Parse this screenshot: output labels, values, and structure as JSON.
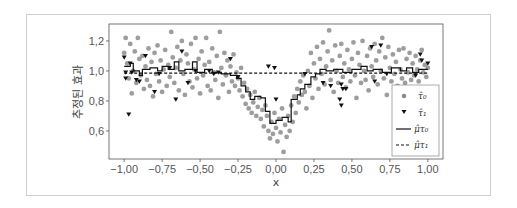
{
  "chart_data": {
    "type": "scatter",
    "title": "",
    "xlabel": "x",
    "ylabel": "추정된 효과",
    "xlim": [
      -1.1,
      1.1
    ],
    "ylim": [
      0.413,
      1.313
    ],
    "xticks": [
      "-1.00",
      "-0.75",
      "-0.50",
      "-0.25",
      "0.00",
      "0.25",
      "0.50",
      "0.75",
      "1.00"
    ],
    "yticks": [
      "0.6",
      "0.8",
      "1.0",
      "1.2"
    ],
    "grid": false,
    "legend_position": "lower right",
    "legend": [
      "τ̂₀",
      "τ̂₁",
      "μ̂τ₀",
      "μ̂τ₁"
    ],
    "series": [
      {
        "name": "τ̂₀",
        "kind": "scatter",
        "marker": "circle",
        "color": "#8c8c8c",
        "points": [
          [
            -1.0,
            1.12
          ],
          [
            -0.99,
            1.22
          ],
          [
            -0.98,
            1.05
          ],
          [
            -0.97,
            0.95
          ],
          [
            -0.96,
            1.18
          ],
          [
            -0.95,
            0.85
          ],
          [
            -0.94,
            1.0
          ],
          [
            -0.93,
            1.13
          ],
          [
            -0.92,
            0.92
          ],
          [
            -0.91,
            1.22
          ],
          [
            -0.9,
            1.08
          ],
          [
            -0.89,
            0.97
          ],
          [
            -0.88,
            1.1
          ],
          [
            -0.87,
            0.88
          ],
          [
            -0.86,
            1.03
          ],
          [
            -0.85,
            0.94
          ],
          [
            -0.84,
            1.15
          ],
          [
            -0.83,
            0.9
          ],
          [
            -0.82,
            1.06
          ],
          [
            -0.81,
            0.83
          ],
          [
            -0.8,
            1.12
          ],
          [
            -0.79,
            0.98
          ],
          [
            -0.78,
            1.17
          ],
          [
            -0.77,
            0.93
          ],
          [
            -0.76,
            1.07
          ],
          [
            -0.75,
            0.86
          ],
          [
            -0.74,
            1.01
          ],
          [
            -0.73,
            1.14
          ],
          [
            -0.72,
            0.9
          ],
          [
            -0.71,
            1.04
          ],
          [
            -0.7,
            0.96
          ],
          [
            -0.69,
            1.26
          ],
          [
            -0.68,
            1.09
          ],
          [
            -0.67,
            0.92
          ],
          [
            -0.66,
            1.02
          ],
          [
            -0.65,
            1.16
          ],
          [
            -0.64,
            0.87
          ],
          [
            -0.63,
            1.07
          ],
          [
            -0.62,
            1.2
          ],
          [
            -0.61,
            0.98
          ],
          [
            -0.6,
            0.84
          ],
          [
            -0.59,
            1.11
          ],
          [
            -0.58,
            1.05
          ],
          [
            -0.57,
            0.93
          ],
          [
            -0.56,
            1.18
          ],
          [
            -0.55,
            0.89
          ],
          [
            -0.54,
            1.01
          ],
          [
            -0.53,
            1.22
          ],
          [
            -0.52,
            0.95
          ],
          [
            -0.51,
            1.08
          ],
          [
            -0.5,
            0.85
          ],
          [
            -0.49,
            1.13
          ],
          [
            -0.48,
            0.97
          ],
          [
            -0.47,
            1.04
          ],
          [
            -0.46,
            1.22
          ],
          [
            -0.45,
            0.9
          ],
          [
            -0.44,
            1.06
          ],
          [
            -0.43,
            0.87
          ],
          [
            -0.42,
            1.15
          ],
          [
            -0.41,
            0.99
          ],
          [
            -0.4,
            0.94
          ],
          [
            -0.39,
            1.1
          ],
          [
            -0.38,
            0.82
          ],
          [
            -0.37,
            1.26
          ],
          [
            -0.36,
            1.02
          ],
          [
            -0.35,
            0.91
          ],
          [
            -0.34,
            1.12
          ],
          [
            -0.33,
            0.97
          ],
          [
            -0.32,
            1.07
          ],
          [
            -0.31,
            0.86
          ],
          [
            -0.3,
            1.03
          ],
          [
            -0.29,
            0.93
          ],
          [
            -0.28,
            1.11
          ],
          [
            -0.27,
            0.9
          ],
          [
            -0.26,
            0.99
          ],
          [
            -0.25,
            0.95
          ],
          [
            -0.24,
            0.87
          ],
          [
            -0.23,
            1.02
          ],
          [
            -0.22,
            0.83
          ],
          [
            -0.21,
            0.92
          ],
          [
            -0.2,
            0.78
          ],
          [
            -0.19,
            0.88
          ],
          [
            -0.18,
            0.75
          ],
          [
            -0.17,
            0.84
          ],
          [
            -0.16,
            0.72
          ],
          [
            -0.15,
            0.79
          ],
          [
            -0.14,
            0.86
          ],
          [
            -0.13,
            0.7
          ],
          [
            -0.12,
            0.76
          ],
          [
            -0.11,
            0.82
          ],
          [
            -0.1,
            0.68
          ],
          [
            -0.09,
            0.74
          ],
          [
            -0.08,
            0.63
          ],
          [
            -0.07,
            0.77
          ],
          [
            -0.06,
            0.7
          ],
          [
            -0.05,
            0.6
          ],
          [
            -0.04,
            0.55
          ],
          [
            -0.03,
            0.66
          ],
          [
            -0.02,
            0.58
          ],
          [
            -0.01,
            0.72
          ],
          [
            0.0,
            0.62
          ],
          [
            0.01,
            0.53
          ],
          [
            0.02,
            0.68
          ],
          [
            0.03,
            0.59
          ],
          [
            0.04,
            0.75
          ],
          [
            0.05,
            0.46
          ],
          [
            0.06,
            0.64
          ],
          [
            0.07,
            0.56
          ],
          [
            0.08,
            0.7
          ],
          [
            0.09,
            0.6
          ],
          [
            0.1,
            0.77
          ],
          [
            0.11,
            0.66
          ],
          [
            0.12,
            0.83
          ],
          [
            0.13,
            0.72
          ],
          [
            0.14,
            0.88
          ],
          [
            0.15,
            0.79
          ],
          [
            0.16,
            0.93
          ],
          [
            0.17,
            0.84
          ],
          [
            0.18,
            0.97
          ],
          [
            0.19,
            0.86
          ],
          [
            0.2,
            0.75
          ],
          [
            0.21,
            1.0
          ],
          [
            0.22,
            0.9
          ],
          [
            0.23,
            1.12
          ],
          [
            0.24,
            0.82
          ],
          [
            0.25,
            1.05
          ],
          [
            0.26,
            0.95
          ],
          [
            0.27,
            1.16
          ],
          [
            0.28,
            0.88
          ],
          [
            0.29,
            1.08
          ],
          [
            0.3,
            0.98
          ],
          [
            0.31,
            1.19
          ],
          [
            0.32,
            0.91
          ],
          [
            0.33,
            1.03
          ],
          [
            0.34,
            1.13
          ],
          [
            0.35,
            1.27
          ],
          [
            0.36,
            0.94
          ],
          [
            0.37,
            1.07
          ],
          [
            0.38,
            0.86
          ],
          [
            0.39,
            1.17
          ],
          [
            0.4,
            1.0
          ],
          [
            0.41,
            0.92
          ],
          [
            0.42,
            1.1
          ],
          [
            0.43,
            1.18
          ],
          [
            0.44,
            0.96
          ],
          [
            0.45,
            1.05
          ],
          [
            0.46,
            0.89
          ],
          [
            0.47,
            1.14
          ],
          [
            0.48,
            1.01
          ],
          [
            0.49,
            0.93
          ],
          [
            0.5,
            1.08
          ],
          [
            0.51,
            1.19
          ],
          [
            0.52,
            0.97
          ],
          [
            0.53,
            0.82
          ],
          [
            0.54,
            1.12
          ],
          [
            0.55,
            1.04
          ],
          [
            0.56,
            0.92
          ],
          [
            0.57,
            1.2
          ],
          [
            0.58,
            1.0
          ],
          [
            0.59,
            0.94
          ],
          [
            0.6,
            1.1
          ],
          [
            0.61,
            0.87
          ],
          [
            0.62,
            1.15
          ],
          [
            0.63,
            1.03
          ],
          [
            0.64,
            0.96
          ],
          [
            0.65,
            1.18
          ],
          [
            0.66,
            1.07
          ],
          [
            0.67,
            0.91
          ],
          [
            0.68,
            1.13
          ],
          [
            0.69,
            1.0
          ],
          [
            0.7,
            1.22
          ],
          [
            0.71,
            0.95
          ],
          [
            0.72,
            1.09
          ],
          [
            0.73,
            0.84
          ],
          [
            0.74,
            1.16
          ],
          [
            0.75,
            1.02
          ],
          [
            0.76,
            0.93
          ],
          [
            0.77,
            1.11
          ],
          [
            0.78,
            0.98
          ],
          [
            0.79,
            1.06
          ],
          [
            0.8,
            0.9
          ],
          [
            0.81,
            1.14
          ],
          [
            0.82,
            1.01
          ],
          [
            0.83,
            0.95
          ],
          [
            0.84,
            1.15
          ],
          [
            0.85,
            0.92
          ],
          [
            0.86,
            1.08
          ],
          [
            0.87,
            0.99
          ],
          [
            0.88,
            1.12
          ],
          [
            0.89,
            0.94
          ],
          [
            0.9,
            1.05
          ],
          [
            0.91,
            0.97
          ],
          [
            0.92,
            1.1
          ],
          [
            0.93,
            1.01
          ],
          [
            0.94,
            0.93
          ],
          [
            0.95,
            1.07
          ],
          [
            0.96,
            1.14
          ],
          [
            0.97,
            0.99
          ],
          [
            0.98,
            1.04
          ],
          [
            0.99,
            0.96
          ],
          [
            1.0,
            1.02
          ]
        ]
      },
      {
        "name": "τ̂₁",
        "kind": "scatter",
        "marker": "triangle-down",
        "color": "#111111",
        "points": [
          [
            -1.0,
            1.09
          ],
          [
            -0.99,
            0.99
          ],
          [
            -0.99,
            0.95
          ],
          [
            -0.97,
            0.71
          ],
          [
            -0.96,
            1.05
          ],
          [
            -0.95,
            0.99
          ],
          [
            -0.92,
            0.94
          ],
          [
            -0.9,
            0.93
          ],
          [
            -0.86,
            1.1
          ],
          [
            -0.8,
            0.86
          ],
          [
            -0.77,
            0.98
          ],
          [
            -0.7,
            1.02
          ],
          [
            -0.66,
            0.81
          ],
          [
            -0.62,
            1.13
          ],
          [
            -0.58,
            0.92
          ],
          [
            -0.53,
            1.0
          ],
          [
            -0.44,
            1.0
          ],
          [
            -0.41,
            0.98
          ],
          [
            -0.38,
            0.99
          ],
          [
            -0.3,
            1.08
          ],
          [
            -0.25,
            0.96
          ],
          [
            -0.05,
            1.03
          ],
          [
            -0.01,
            1.02
          ],
          [
            0.0,
            0.81
          ],
          [
            0.19,
            0.98
          ],
          [
            0.31,
            0.92
          ],
          [
            0.36,
            0.9
          ],
          [
            0.42,
            0.81
          ],
          [
            0.43,
            0.77
          ],
          [
            0.43,
            0.91
          ],
          [
            0.44,
            0.88
          ],
          [
            0.46,
            0.88
          ],
          [
            0.63,
            1.16
          ],
          [
            0.65,
            0.93
          ],
          [
            0.69,
            1.17
          ],
          [
            0.73,
            0.98
          ],
          [
            0.92,
            0.97
          ],
          [
            0.95,
            1.11
          ],
          [
            0.96,
            1.07
          ],
          [
            1.0,
            1.05
          ]
        ]
      },
      {
        "name": "μ̂τ₀",
        "kind": "step",
        "style": "solid",
        "color": "#111111",
        "points": [
          [
            -1.0,
            1.03
          ],
          [
            -0.96,
            1.05
          ],
          [
            -0.94,
            1.0
          ],
          [
            -0.9,
            0.97
          ],
          [
            -0.88,
            1.01
          ],
          [
            -0.83,
            1.02
          ],
          [
            -0.78,
            1.0
          ],
          [
            -0.75,
            1.03
          ],
          [
            -0.71,
            1.01
          ],
          [
            -0.67,
            1.06
          ],
          [
            -0.64,
            1.0
          ],
          [
            -0.6,
            1.01
          ],
          [
            -0.55,
            1.06
          ],
          [
            -0.52,
            0.99
          ],
          [
            -0.47,
            1.01
          ],
          [
            -0.42,
            0.99
          ],
          [
            -0.36,
            0.98
          ],
          [
            -0.3,
            0.97
          ],
          [
            -0.26,
            0.95
          ],
          [
            -0.23,
            0.9
          ],
          [
            -0.2,
            0.86
          ],
          [
            -0.17,
            0.81
          ],
          [
            -0.14,
            0.83
          ],
          [
            -0.1,
            0.82
          ],
          [
            -0.07,
            0.73
          ],
          [
            -0.04,
            0.65
          ],
          [
            0.0,
            0.67
          ],
          [
            0.04,
            0.69
          ],
          [
            0.08,
            0.66
          ],
          [
            0.1,
            0.81
          ],
          [
            0.14,
            0.84
          ],
          [
            0.16,
            0.88
          ],
          [
            0.19,
            0.91
          ],
          [
            0.23,
            0.96
          ],
          [
            0.26,
            0.98
          ],
          [
            0.29,
            1.01
          ],
          [
            0.33,
            1.0
          ],
          [
            0.38,
            1.01
          ],
          [
            0.44,
            0.99
          ],
          [
            0.5,
            1.01
          ],
          [
            0.56,
            1.03
          ],
          [
            0.6,
            1.0
          ],
          [
            0.64,
            1.01
          ],
          [
            0.7,
            0.99
          ],
          [
            0.76,
            1.02
          ],
          [
            0.82,
            1.0
          ],
          [
            0.86,
            1.02
          ],
          [
            0.9,
            0.99
          ],
          [
            0.94,
            1.01
          ],
          [
            1.0,
            1.01
          ]
        ]
      },
      {
        "name": "μ̂τ₁",
        "kind": "line",
        "style": "dashed",
        "color": "#111111",
        "points": [
          [
            -1.0,
            0.985
          ],
          [
            1.0,
            0.985
          ]
        ]
      }
    ]
  }
}
